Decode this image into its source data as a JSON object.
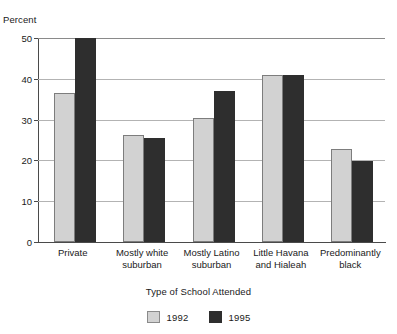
{
  "chart_data": {
    "type": "bar",
    "title": "",
    "subtitle": "",
    "xlabel": "Type of School Attended",
    "ylabel": "Percent",
    "ylim": [
      0,
      50
    ],
    "yticks": [
      0,
      10,
      20,
      30,
      40,
      50
    ],
    "ytick_labels": [
      "0",
      "10",
      "20",
      "30",
      "40",
      "50"
    ],
    "grid": true,
    "legend_position": "bottom-center",
    "categories": [
      "Private",
      "Mostly white\nsuburban",
      "Mostly Latino\nsuburban",
      "Little Havana\nand Hialeah",
      "Predominantly\nblack"
    ],
    "series": [
      {
        "name": "1992",
        "color": "#d2d2d2",
        "values": [
          36.5,
          26.3,
          30.5,
          41.0,
          22.8
        ]
      },
      {
        "name": "1995",
        "color": "#2e2e2e",
        "values": [
          50.0,
          25.5,
          37.0,
          41.0,
          19.8
        ]
      }
    ]
  },
  "legend": {
    "items": [
      {
        "label": "1992"
      },
      {
        "label": "1995"
      }
    ]
  }
}
